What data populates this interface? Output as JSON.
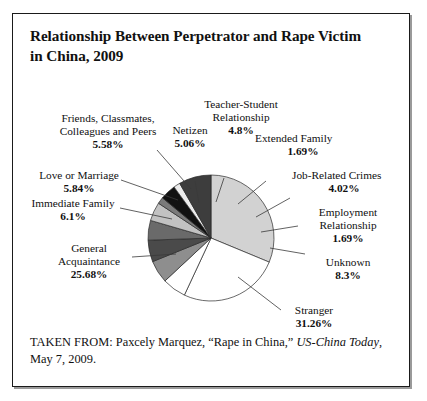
{
  "figure": {
    "title": "Relationship Between Perpetrator and Rape Victim in China, 2009",
    "title_line1": "Relationship Between Perpetrator and Rape Victim",
    "title_line2": "in China, 2009",
    "source_prefix": "TAKEN FROM: Paxcely Marquez, “Rape in China,” ",
    "source_publication": "US-China Today",
    "source_suffix": ", May 7, 2009."
  },
  "labels": {
    "teacher_student": {
      "line1": "Teacher-Student",
      "line2": "Relationship",
      "pct": "4.8%"
    },
    "netizen": {
      "line1": "Netizen",
      "pct": "5.06%"
    },
    "extended_family": {
      "line1": "Extended Family",
      "pct": "1.69%"
    },
    "job_related": {
      "line1": "Job-Related Crimes",
      "pct": "4.02%"
    },
    "employment": {
      "line1": "Employment",
      "line2": "Relationship",
      "pct": "1.69%"
    },
    "unknown": {
      "line1": "Unknown",
      "pct": "8.3%"
    },
    "stranger": {
      "line1": "Stranger",
      "pct": "31.26%"
    },
    "general_acq": {
      "line1": "General",
      "line2": "Acquaintance",
      "pct": "25.68%"
    },
    "immediate_family": {
      "line1": "Immediate Family",
      "pct": "6.1%"
    },
    "love_marriage": {
      "line1": "Love or Marriage",
      "pct": "5.84%"
    },
    "friends": {
      "line1": "Friends, Classmates,",
      "line2": "Colleagues and Peers",
      "pct": "5.58%"
    }
  },
  "chart_data": {
    "type": "pie",
    "title": "Relationship Between Perpetrator and Rape Victim in China, 2009",
    "unit": "percent",
    "legend": "none",
    "labels_position": "outside-with-leader-lines",
    "start_angle_deg": 0,
    "direction": "clockwise",
    "categories": [
      "Stranger",
      "General Acquaintance",
      "Unknown",
      "Immediate Family",
      "Love or Marriage",
      "Friends, Classmates, Colleagues and Peers",
      "Netizen",
      "Teacher-Student Relationship",
      "Job-Related Crimes",
      "Extended Family",
      "Employment Relationship"
    ],
    "values": [
      31.26,
      25.68,
      8.3,
      6.1,
      5.84,
      5.58,
      5.06,
      4.8,
      4.02,
      1.69,
      1.69
    ],
    "colors": [
      "#d2d2d2",
      "#ffffff",
      "#3d3d3d",
      "#ffffff",
      "#8e8e8e",
      "#bcbcbc",
      "#c9c9c9",
      "#6e6e6e",
      "#2b2b2b",
      "#111111",
      "#e4e4e4"
    ],
    "slices": [
      {
        "name": "Stranger",
        "value": 31.26,
        "color": "#d2d2d2",
        "start_deg": 0,
        "end_deg": 112.5
      },
      {
        "name": "General Acquaintance",
        "value": 25.68,
        "color": "#ffffff",
        "start_deg": 112.5,
        "end_deg": 205.0
      },
      {
        "name": "Immediate Family",
        "value": 6.1,
        "color": "#ffffff",
        "start_deg": 205.0,
        "end_deg": 227.0
      },
      {
        "name": "Love or Marriage",
        "value": 5.84,
        "color": "#8e8e8e",
        "start_deg": 227.0,
        "end_deg": 248.0
      },
      {
        "name": "Friends, Classmates, Colleagues and Peers",
        "value": 5.58,
        "color": "#4a4a4a",
        "start_deg": 248.0,
        "end_deg": 268.0
      },
      {
        "name": "Netizen",
        "value": 5.06,
        "color": "#6a6a6a",
        "start_deg": 268.0,
        "end_deg": 286.2
      },
      {
        "name": "Teacher-Student Relationship",
        "value": 4.8,
        "color": "#c2c2c2",
        "start_deg": 286.2,
        "end_deg": 303.5
      },
      {
        "name": "Extended Family",
        "value": 1.69,
        "color": "#7a7a7a",
        "start_deg": 303.5,
        "end_deg": 309.6
      },
      {
        "name": "Job-Related Crimes",
        "value": 4.02,
        "color": "#111111",
        "start_deg": 309.6,
        "end_deg": 324.1
      },
      {
        "name": "Employment Relationship",
        "value": 1.69,
        "color": "#ececec",
        "start_deg": 324.1,
        "end_deg": 330.2
      },
      {
        "name": "Unknown",
        "value": 8.3,
        "color": "#3d3d3d",
        "start_deg": 330.2,
        "end_deg": 360.0
      }
    ],
    "total": 100.02
  }
}
